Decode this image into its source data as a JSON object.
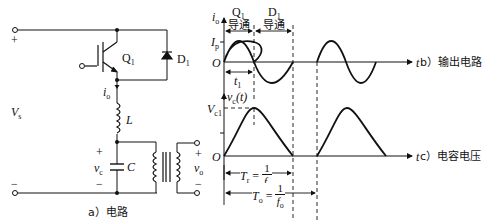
{
  "circuit": {
    "caption": "a）电路",
    "supply_label": "V",
    "supply_sub": "s",
    "plus_sign": "+",
    "minus_sign": "−",
    "switch_label": "Q",
    "switch_sub": "1",
    "diode_label": "D",
    "diode_sub": "1",
    "current_label": "i",
    "current_sub": "o",
    "inductor_label": "L",
    "cap_label": "C",
    "cap_voltage_label": "v",
    "cap_voltage_sub": "c",
    "cap_plus": "+",
    "cap_minus": "−",
    "output_label": "v",
    "output_sub": "o",
    "out_plus": "+",
    "out_minus": "−"
  },
  "waveform_b": {
    "caption": "b）输出电路",
    "y_axis_label": "i",
    "y_axis_sub": "o",
    "peak_label": "I",
    "peak_sub": "p",
    "origin": "O",
    "t_axis": "t",
    "q1_label": "Q",
    "q1_sub": "1",
    "q1_text": "导通",
    "d1_label": "D",
    "d1_sub": "1",
    "d1_text": "导通",
    "t1_label": "t",
    "t1_sub": "1"
  },
  "waveform_c": {
    "caption": "c）电容电压",
    "y_axis_label": "v",
    "y_axis_sub": "c",
    "y_axis_arg": "(t)",
    "peak_label": "V",
    "peak_sub": "c1",
    "origin": "O",
    "t_axis": "t",
    "tr_label": "T",
    "tr_sub": "r",
    "tr_eq": " = ",
    "tr_num": "1",
    "tr_den": "f",
    "tr_den_sub": "r",
    "to_label": "T",
    "to_sub": "o",
    "to_eq": " = ",
    "to_num": "1",
    "to_den": "f",
    "to_den_sub": "o"
  }
}
